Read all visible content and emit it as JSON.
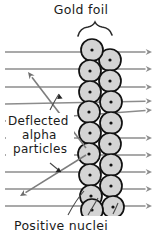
{
  "diagram": {
    "name": "rutherford-gold-foil-scattering-diagram",
    "width": 163,
    "height": 237,
    "background_color": "#ffffff"
  },
  "labels": {
    "title": "Gold foil",
    "side_line1": "Deflected",
    "side_line2": "alpha",
    "side_line3": "particles",
    "bottom": "Positive nuclei"
  },
  "colors": {
    "beam": "#8c8c8c",
    "deflected_beam": "#7d7d7d",
    "atom_fill": "#d4d4d4",
    "atom_outline": "#111111",
    "nucleus": "#111111",
    "text": "#1a1a1a",
    "brace": "#2a2a2a",
    "background": "#ffffff"
  },
  "chart_data": {
    "type": "scatter",
    "title": "Gold foil",
    "xlabel": "",
    "ylabel": "",
    "annotations": [
      "Gold foil",
      "Deflected alpha particles",
      "Positive nuclei"
    ],
    "beam_lines": [
      {
        "id": "beam-1",
        "x1": 5,
        "y1": 52,
        "x2": 152,
        "y2": 52,
        "deflected": false
      },
      {
        "id": "beam-2",
        "x1": 5,
        "y1": 69,
        "x2": 152,
        "y2": 69,
        "deflected": false
      },
      {
        "id": "beam-3",
        "x1": 5,
        "y1": 87,
        "x2": 152,
        "y2": 87,
        "deflected": false
      },
      {
        "id": "beam-4",
        "x1": 5,
        "y1": 104,
        "x2": 152,
        "y2": 101,
        "deflected": true
      },
      {
        "id": "beam-5",
        "x1": 5,
        "y1": 121,
        "x2": 152,
        "y2": 110,
        "deflected": true
      },
      {
        "id": "beam-6",
        "x1": 5,
        "y1": 138,
        "x2": 152,
        "y2": 138,
        "deflected": false
      },
      {
        "id": "beam-7",
        "x1": 5,
        "y1": 155,
        "x2": 152,
        "y2": 155,
        "deflected": false
      },
      {
        "id": "beam-8",
        "x1": 5,
        "y1": 172,
        "x2": 152,
        "y2": 172,
        "deflected": false
      },
      {
        "id": "beam-9",
        "x1": 5,
        "y1": 189,
        "x2": 152,
        "y2": 189,
        "deflected": false
      },
      {
        "id": "beam-10",
        "x1": 5,
        "y1": 206,
        "x2": 152,
        "y2": 206,
        "deflected": false
      }
    ],
    "deflected_rays": [
      {
        "id": "deflect-up",
        "from_x": 86,
        "from_y": 148,
        "to_x": 28,
        "to_y": 72
      },
      {
        "id": "deflect-down",
        "from_x": 86,
        "from_y": 155,
        "to_x": 20,
        "to_y": 196
      }
    ],
    "atoms_left_column": [
      {
        "cx": 92,
        "cy": 50,
        "r": 11
      },
      {
        "cx": 90,
        "cy": 71,
        "r": 11
      },
      {
        "cx": 90,
        "cy": 92,
        "r": 11
      },
      {
        "cx": 89,
        "cy": 112,
        "r": 11
      },
      {
        "cx": 90,
        "cy": 133,
        "r": 11
      },
      {
        "cx": 89,
        "cy": 154,
        "r": 11
      },
      {
        "cx": 90,
        "cy": 175,
        "r": 11
      },
      {
        "cx": 91,
        "cy": 196,
        "r": 11
      },
      {
        "cx": 92,
        "cy": 210,
        "r": 11
      }
    ],
    "atoms_right_column": [
      {
        "cx": 110,
        "cy": 60,
        "r": 11
      },
      {
        "cx": 110,
        "cy": 81,
        "r": 11
      },
      {
        "cx": 111,
        "cy": 102,
        "r": 11
      },
      {
        "cx": 111,
        "cy": 123,
        "r": 11
      },
      {
        "cx": 110,
        "cy": 144,
        "r": 11
      },
      {
        "cx": 111,
        "cy": 165,
        "r": 11
      },
      {
        "cx": 111,
        "cy": 186,
        "r": 11
      },
      {
        "cx": 113,
        "cy": 207,
        "r": 11
      }
    ],
    "nucleus_radius": 1.6,
    "grid": false,
    "legend": "none"
  }
}
